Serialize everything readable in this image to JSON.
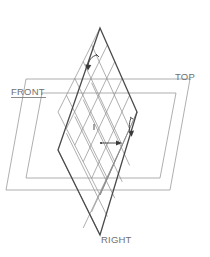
{
  "diagram": {
    "background_color": "#ffffff",
    "labels": {
      "front": "FRONT",
      "top": "TOP",
      "right": "RIGHT"
    },
    "label_color": "#6f6f6f",
    "plane_stroke_color": "#9a9a9a",
    "grid_stroke_color": "#8d8d8d",
    "outline_stroke_color": "#4a4a4a",
    "annotation_color": "#3a3a3a",
    "icons": {
      "top_arrow": "curved-arrow-icon",
      "center_arrow": "right-arrow-icon",
      "right_arrow": "small-arrow-icon"
    },
    "geometry": {
      "rhombus_vertices": [
        {
          "x": 100,
          "y": 28
        },
        {
          "x": 137,
          "y": 112
        },
        {
          "x": 100,
          "y": 235
        },
        {
          "x": 58,
          "y": 150
        }
      ],
      "grid_divisions": 5,
      "top_plane_points": "22,86 178,86 188,182 32,182",
      "front_plane_points": "8,100 164,100 174,196 18,196"
    }
  }
}
